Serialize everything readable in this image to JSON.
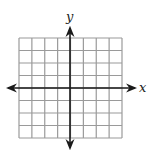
{
  "diagram": {
    "type": "coordinate-grid",
    "grid": {
      "columns": 8,
      "rows": 8,
      "line_color": "#9a9a9a"
    },
    "axes": {
      "x_label": "x",
      "y_label": "y",
      "axis_color": "#1a1a1a",
      "arrows": "both-ends"
    }
  }
}
